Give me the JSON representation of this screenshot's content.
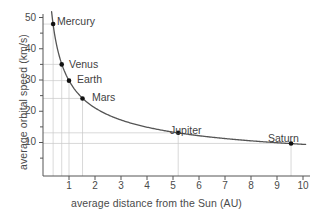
{
  "chart_data": {
    "type": "line",
    "title": "",
    "xlabel": "average distance from the Sun (AU)",
    "ylabel": "average orbital speed (km/s)",
    "xlim": [
      0,
      10.4
    ],
    "ylim": [
      0,
      52
    ],
    "xticks": [
      1,
      2,
      3,
      4,
      5,
      6,
      7,
      8,
      9,
      10
    ],
    "yticks": [
      10,
      20,
      30,
      40,
      50
    ],
    "yminorticks": [
      5,
      15,
      25,
      35,
      45
    ],
    "grid": "droplines-per-point",
    "legend": "none",
    "curve_note": "v = 29.8 / sqrt(r) km/s",
    "points": [
      {
        "label": "Mercury",
        "x": 0.39,
        "y": 47.9
      },
      {
        "label": "Venus",
        "x": 0.72,
        "y": 35.0
      },
      {
        "label": "Earth",
        "x": 1.0,
        "y": 29.8
      },
      {
        "label": "Mars",
        "x": 1.52,
        "y": 24.1
      },
      {
        "label": "Jupiter",
        "x": 5.2,
        "y": 13.1
      },
      {
        "label": "Saturn",
        "x": 9.54,
        "y": 9.7
      }
    ],
    "colors": {
      "curve": "#555555",
      "marker": "#111111",
      "axis": "#555555",
      "grid": "#c8c8c8",
      "text": "#4a4a4a",
      "background": "#ffffff"
    }
  },
  "labels": {
    "mercury": "Mercury",
    "venus": "Venus",
    "earth": "Earth",
    "mars": "Mars",
    "jupiter": "Jupiter",
    "saturn": "Saturn"
  },
  "ytick_text": {
    "t50": "50",
    "t40": "40",
    "t30": "30",
    "t20": "20",
    "t10": "10"
  },
  "xtick_text": {
    "t1": "1",
    "t2": "2",
    "t3": "3",
    "t4": "4",
    "t5": "5",
    "t6": "6",
    "t7": "7",
    "t8": "8",
    "t9": "9",
    "t10": "10"
  }
}
